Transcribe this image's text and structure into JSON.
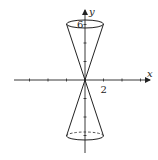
{
  "diagram": {
    "x_axis": {
      "label": "x",
      "tick_values": [
        -6,
        -4,
        -2,
        2,
        4,
        6
      ],
      "labeled_tick": {
        "value": 2,
        "text": "2"
      }
    },
    "y_axis": {
      "label": "y",
      "tick_values": [
        -6,
        -4,
        -2,
        2,
        4,
        6
      ],
      "labeled_tick": {
        "value": 6,
        "text": "6"
      }
    },
    "cone": {
      "apex": [
        0,
        0
      ],
      "upper_nappe": {
        "height": 6,
        "radius": 2
      },
      "lower_nappe": {
        "height": -6,
        "radius": 2,
        "back_edge_style": "dashed"
      }
    },
    "colors": {
      "stroke": "#222222",
      "background": "#ffffff"
    }
  }
}
